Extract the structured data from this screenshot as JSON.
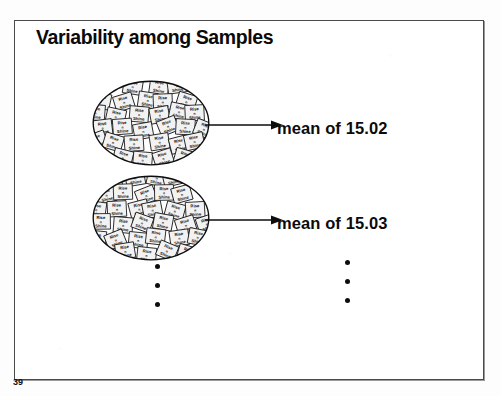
{
  "slide": {
    "title": "Variability among Samples",
    "page_number": "39",
    "background_color": "#ffffff",
    "border_color": "#4a4a4a",
    "text_color": "#0a0a0a"
  },
  "samples": [
    {
      "id": "sample-1",
      "ellipse_label": "population sample cluster 1",
      "box_label_line1": "Rise",
      "box_label_line2": "n",
      "box_label_line3": "Shine",
      "box_count": 38,
      "mean_label": "mean of 15.02",
      "mean_value": "15.02"
    },
    {
      "id": "sample-2",
      "ellipse_label": "population sample cluster 2",
      "box_label_line1": "Rise",
      "box_label_line2": "n",
      "box_label_line3": "Shine",
      "box_count": 38,
      "mean_label": "mean of 15.03",
      "mean_value": "15.03"
    }
  ],
  "continuation": {
    "left_column_label": "vertical ellipsis under samples",
    "right_column_label": "vertical ellipsis under means",
    "dot_count": 3
  },
  "icons": {
    "arrow_right": "arrow-right-icon",
    "ellipsis_vertical": "ellipsis-vertical-icon"
  }
}
